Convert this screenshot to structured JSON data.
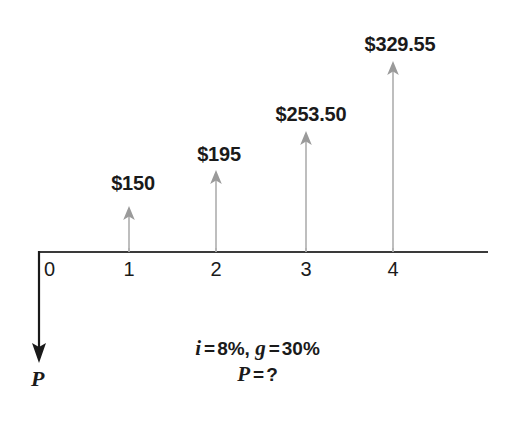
{
  "diagram": {
    "type": "cash-flow-timeline",
    "axis": {
      "label": "period",
      "start_x": 38,
      "end_x": 488,
      "baseline_y": 252,
      "color": "#3a3a3a"
    },
    "periods": [
      {
        "label": "0",
        "x": 50,
        "tick_x": 39
      },
      {
        "label": "1",
        "x": 129,
        "tick_x": 129
      },
      {
        "label": "2",
        "x": 216,
        "tick_x": 216
      },
      {
        "label": "3",
        "x": 306,
        "tick_x": 306
      },
      {
        "label": "4",
        "x": 393,
        "tick_x": 393
      }
    ],
    "cash_flows": [
      {
        "period": 1,
        "label": "$150",
        "value": 150.0,
        "x": 129,
        "tip_y": 206,
        "label_y": 172
      },
      {
        "period": 2,
        "label": "$195",
        "value": 195.0,
        "x": 216,
        "tip_y": 170,
        "label_y": 143
      },
      {
        "period": 3,
        "label": "$253.50",
        "value": 253.5,
        "x": 306,
        "tip_y": 131,
        "label_y": 103
      },
      {
        "period": 4,
        "label": "$329.55",
        "value": 329.55,
        "x": 393,
        "tip_y": 61,
        "label_y": 33
      }
    ],
    "present_value_arrow": {
      "label": "P",
      "x": 39,
      "from_y": 252,
      "to_y": 362,
      "label_x": 32,
      "label_y": 368,
      "color": "#1a1a1a"
    },
    "notes": {
      "interest_symbol": "i",
      "interest_equals": "=",
      "interest_value": "8%,",
      "growth_symbol": "g",
      "growth_equals": "=",
      "growth_value": "30%",
      "unknown_symbol": "P",
      "unknown_equals": "=",
      "unknown_value": "?"
    },
    "colors": {
      "arrow_gray": "#9a9a9a",
      "axis_dark": "#3a3a3a",
      "text": "#1a1a1a",
      "background": "#ffffff"
    }
  }
}
